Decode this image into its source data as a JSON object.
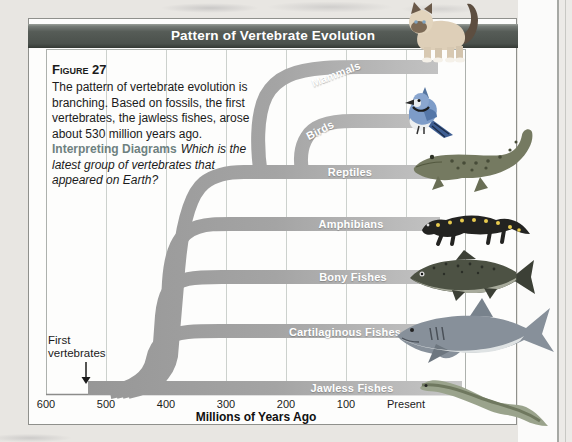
{
  "page": {
    "title": "Pattern of Vertebrate Evolution"
  },
  "figure": {
    "label": "Figure 27",
    "body_lines": [
      "The pattern of vertebrate evolution is",
      "branching. Based on fossils, the first",
      "vertebrates, the jawless fishes, arose",
      "about 530 million years ago."
    ],
    "interpreting_label": "Interpreting Diagrams",
    "question_lines": [
      "Which is the",
      "latest group of vertebrates that",
      "appeared on Earth?"
    ]
  },
  "tree": {
    "branches": [
      {
        "label": "Mammals",
        "animal": "cat"
      },
      {
        "label": "Birds",
        "animal": "blue-jay"
      },
      {
        "label": "Reptiles",
        "animal": "crocodile"
      },
      {
        "label": "Amphibians",
        "animal": "salamander"
      },
      {
        "label": "Bony Fishes",
        "animal": "trout"
      },
      {
        "label": "Cartilaginous Fishes",
        "animal": "shark"
      },
      {
        "label": "Jawless Fishes",
        "animal": "lamprey"
      }
    ],
    "annotation": {
      "line1": "First",
      "line2": "vertebrates"
    }
  },
  "axis": {
    "ticks": [
      "600",
      "500",
      "400",
      "300",
      "200",
      "100",
      "Present"
    ],
    "title": "Millions of Years Ago"
  },
  "colors": {
    "title_bar": "#565c57",
    "branch_dark": "#969696",
    "branch_light": "#c8c8c8",
    "interpreting": "#6e8180"
  }
}
